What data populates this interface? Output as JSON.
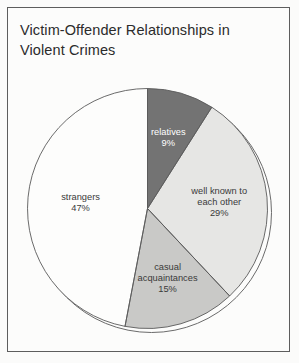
{
  "figure": {
    "title_line1": "Victim-Offender Relationships in",
    "title_line2": "Violent Crimes",
    "background_color": "#fbfbfa",
    "frame_color": "#5d5d5d"
  },
  "chart_data": {
    "type": "pie",
    "title": "Victim-Offender Relationships in Violent Crimes",
    "xlabel": "",
    "ylabel": "",
    "units": "percent",
    "total": 100,
    "start_angle_deg": 0,
    "direction": "clockwise",
    "legend": "none (labels drawn inside slices)",
    "grid": false,
    "categories": [
      "relatives",
      "well known to each other",
      "casual acquaintances",
      "strangers"
    ],
    "values": [
      9,
      29,
      15,
      47
    ],
    "slices": [
      {
        "label": "relatives",
        "label_line1": "relatives",
        "label_line2": "",
        "value": 9,
        "value_text": "9%",
        "color": "#737373",
        "text_color": "#ffffff",
        "start_deg": 0,
        "end_deg": 32.4
      },
      {
        "label": "well known to each other",
        "label_line1": "well known to",
        "label_line2": "each other",
        "value": 29,
        "value_text": "29%",
        "color": "#e6e6e4",
        "text_color": "#3a3a3a",
        "start_deg": 32.4,
        "end_deg": 136.8
      },
      {
        "label": "casual acquaintances",
        "label_line1": "casual",
        "label_line2": "acquaintances",
        "value": 15,
        "value_text": "15%",
        "color": "#c9c9c7",
        "text_color": "#3a3a3a",
        "start_deg": 136.8,
        "end_deg": 190.8
      },
      {
        "label": "strangers",
        "label_line1": "strangers",
        "label_line2": "",
        "value": 47,
        "value_text": "47%",
        "color": "#fdfdfc",
        "text_color": "#3a3a3a",
        "start_deg": 190.8,
        "end_deg": 360
      }
    ]
  }
}
